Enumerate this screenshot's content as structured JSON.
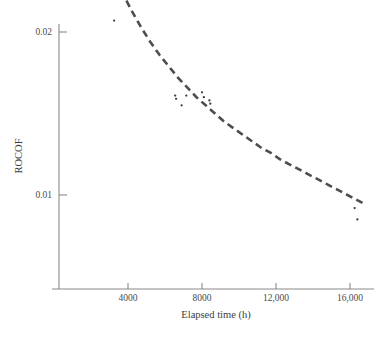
{
  "chart_data": {
    "type": "scatter",
    "title": "",
    "xlabel": "Elapsed time (h)",
    "ylabel": "ROCOF",
    "xlim": [
      270,
      17400
    ],
    "ylim": [
      0,
      0.0332
    ],
    "grid": false,
    "legend": null,
    "xticks": [
      4000,
      8000,
      12000,
      16000
    ],
    "xtick_labels": [
      "4000",
      "8000",
      "12,000",
      "16,000"
    ],
    "yticks": [
      0.01,
      0.02,
      0.03
    ],
    "ytick_labels": [
      "0.01",
      "0.02",
      "0.03"
    ],
    "series": [
      {
        "name": "observed ROCOF",
        "type": "scatter",
        "marker": "dot",
        "color": "#3c3c3c",
        "points": [
          [
            2600,
            0.0301
          ],
          [
            2900,
            0.0294
          ],
          [
            2300,
            0.0243
          ],
          [
            2350,
            0.024
          ],
          [
            3350,
            0.0231
          ],
          [
            3400,
            0.023
          ],
          [
            4050,
            0.0252
          ],
          [
            4150,
            0.0248
          ],
          [
            3250,
            0.0207
          ],
          [
            4300,
            0.0228
          ],
          [
            4800,
            0.0224
          ],
          [
            4850,
            0.0222
          ],
          [
            6550,
            0.0161
          ],
          [
            6600,
            0.0159
          ],
          [
            6900,
            0.0155
          ],
          [
            7150,
            0.0161
          ],
          [
            8000,
            0.0163
          ],
          [
            8100,
            0.016
          ],
          [
            8400,
            0.0158
          ],
          [
            8450,
            0.0156
          ],
          [
            16250,
            0.0092
          ],
          [
            16400,
            0.0085
          ]
        ]
      },
      {
        "name": "fitted ROCOF curve",
        "type": "line",
        "style": "dashed",
        "color": "#4d4d4d",
        "points": [
          [
            1200,
            0.0298
          ],
          [
            1700,
            0.0281
          ],
          [
            2200,
            0.0265
          ],
          [
            2700,
            0.025
          ],
          [
            3200,
            0.0236
          ],
          [
            3700,
            0.0224
          ],
          [
            4200,
            0.0213
          ],
          [
            4700,
            0.0203
          ],
          [
            5200,
            0.0194
          ],
          [
            5700,
            0.0186
          ],
          [
            6200,
            0.0179
          ],
          [
            6700,
            0.0172
          ],
          [
            7200,
            0.0166
          ],
          [
            7700,
            0.016
          ],
          [
            8200,
            0.0155
          ],
          [
            8700,
            0.015
          ],
          [
            9200,
            0.0145
          ],
          [
            9700,
            0.0141
          ],
          [
            10200,
            0.0137
          ],
          [
            10700,
            0.0133
          ],
          [
            11200,
            0.0129
          ],
          [
            11700,
            0.0126
          ],
          [
            12200,
            0.0122
          ],
          [
            12700,
            0.0119
          ],
          [
            13200,
            0.0116
          ],
          [
            13700,
            0.0113
          ],
          [
            14200,
            0.011
          ],
          [
            14700,
            0.0107
          ],
          [
            15200,
            0.0104
          ],
          [
            15700,
            0.0101
          ],
          [
            16200,
            0.0098
          ],
          [
            16700,
            0.0095
          ]
        ]
      }
    ]
  },
  "axes": {
    "y_axis_name": "ROCOF",
    "x_axis_name": "Elapsed time (h)"
  }
}
